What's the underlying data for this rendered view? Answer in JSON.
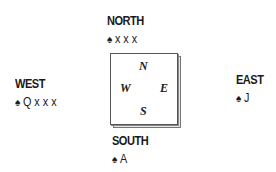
{
  "hands": {
    "north": {
      "label": "NORTH",
      "suit_icon": "♠",
      "cards": "x x x"
    },
    "west": {
      "label": "WEST",
      "suit_icon": "♠",
      "cards": "Q x x x"
    },
    "east": {
      "label": "EAST",
      "suit_icon": "♠",
      "cards": "J"
    },
    "south": {
      "label": "SOUTH",
      "suit_icon": "♠",
      "cards": "A"
    }
  },
  "compass": {
    "n": "N",
    "e": "E",
    "s": "S",
    "w": "W"
  }
}
